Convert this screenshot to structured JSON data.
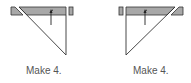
{
  "figures": [
    {
      "id": "left",
      "caption": "Make 4.",
      "orientation": "diagonal-from-left"
    },
    {
      "id": "right",
      "caption": "Make 4.",
      "orientation": "diagonal-from-right"
    }
  ],
  "colors": {
    "strip_fill": "#a8a8a8",
    "stroke": "#333333",
    "label": "#555555",
    "background": "#ffffff"
  }
}
